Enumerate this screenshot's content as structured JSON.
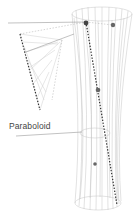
{
  "diagram": {
    "label": "Paraboloid",
    "colors": {
      "wire": "#b8b8b8",
      "dash": "#333333",
      "point": "#555555",
      "leader": "#999999"
    }
  }
}
